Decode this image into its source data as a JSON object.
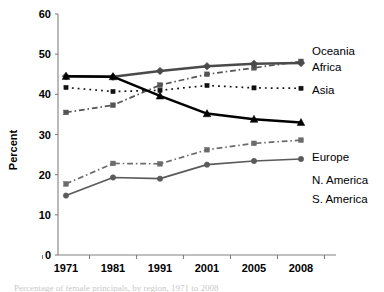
{
  "chart_data": {
    "type": "line",
    "title": "",
    "xlabel": "",
    "ylabel": "Percent",
    "categories": [
      "1971",
      "1981",
      "1991",
      "2001",
      "2005",
      "2008"
    ],
    "ylim": [
      0,
      60
    ],
    "yticks": [
      0,
      10,
      20,
      30,
      40,
      50,
      60
    ],
    "grid": false,
    "legend_position": "right-inline",
    "series": [
      {
        "name": "Oceania",
        "values": [
          35.5,
          37.3,
          42.3,
          45.0,
          46.6,
          48.2
        ],
        "marker": "square",
        "line_style": "dashdot",
        "color": "#555555"
      },
      {
        "name": "Africa",
        "values": [
          44.5,
          44.4,
          45.8,
          47.0,
          47.6,
          47.8
        ],
        "marker": "diamond",
        "line_style": "solid",
        "color": "#4a4a4a"
      },
      {
        "name": "Asia",
        "values": [
          41.7,
          40.7,
          41.0,
          42.2,
          41.6,
          41.5
        ],
        "marker": "square",
        "line_style": "dotted",
        "color": "#111111"
      },
      {
        "name": "Europe",
        "values": [
          44.5,
          44.4,
          39.6,
          35.2,
          33.8,
          33.0
        ],
        "marker": "triangle",
        "line_style": "solid",
        "color": "#000000"
      },
      {
        "name": "N. America",
        "values": [
          17.7,
          22.8,
          22.7,
          26.2,
          27.8,
          28.6
        ],
        "marker": "square",
        "line_style": "dashdot",
        "color": "#6b6b6b"
      },
      {
        "name": "S. America",
        "values": [
          14.8,
          19.3,
          19.0,
          22.5,
          23.4,
          23.9
        ],
        "marker": "circle",
        "line_style": "solid",
        "color": "#5a5a5a"
      }
    ]
  },
  "axis": {
    "y_tick_labels": [
      "0",
      "10",
      "20",
      "30",
      "40",
      "50",
      "60"
    ],
    "x_tick_labels": [
      "1971",
      "1981",
      "1991",
      "2001",
      "2005",
      "2008"
    ],
    "y_axis_title": "Percent"
  },
  "series_labels": {
    "oceania": "Oceania",
    "africa": "Africa",
    "asia": "Asia",
    "europe": "Europe",
    "n_america": "N. America",
    "s_america": "S. America"
  },
  "caption": {
    "text": "Percentage of female principals, by region, 1971 to 2008"
  },
  "colors": {
    "axis": "#808080",
    "text": "#000000",
    "background": "#ffffff"
  }
}
